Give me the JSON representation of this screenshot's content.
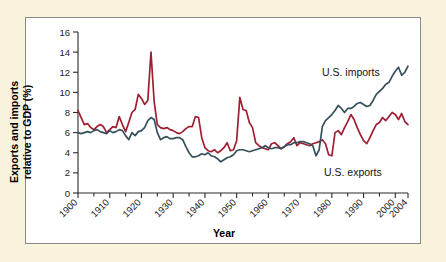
{
  "figure": {
    "background_color": "#f7f3dc",
    "panel_color": "#ffffff",
    "border_color": "#8a8a84"
  },
  "labels": {
    "ylabel_line1": "Exports and imports",
    "ylabel_line2": "relative to GDP (%)",
    "xlabel": "Year",
    "imports_label": "U.S. imports",
    "exports_label": "U.S. exports"
  },
  "chart_data": {
    "type": "line",
    "title": "",
    "xlabel": "Year",
    "ylabel": "Exports and imports relative to GDP (%)",
    "xlim": [
      1900,
      2004
    ],
    "ylim": [
      0,
      16
    ],
    "ytick_values": [
      0,
      2,
      4,
      6,
      8,
      10,
      12,
      14,
      16
    ],
    "xtick_values": [
      1900,
      1910,
      1920,
      1930,
      1940,
      1950,
      1960,
      1970,
      1980,
      1990,
      2000,
      2004
    ],
    "xtick_labels": [
      "1900",
      "1910",
      "1920",
      "1930",
      "1940",
      "1950",
      "1960",
      "1970",
      "1980",
      "1990",
      "2000",
      "2004"
    ],
    "grid": false,
    "legend_position": "inline-annotation",
    "colors": {
      "imports": "#36505c",
      "exports": "#9e1f32"
    },
    "x": [
      1900,
      1901,
      1902,
      1903,
      1904,
      1905,
      1906,
      1907,
      1908,
      1909,
      1910,
      1911,
      1912,
      1913,
      1914,
      1915,
      1916,
      1917,
      1918,
      1919,
      1920,
      1921,
      1922,
      1923,
      1924,
      1925,
      1926,
      1927,
      1928,
      1929,
      1930,
      1931,
      1932,
      1933,
      1934,
      1935,
      1936,
      1937,
      1938,
      1939,
      1940,
      1941,
      1942,
      1943,
      1944,
      1945,
      1946,
      1947,
      1948,
      1949,
      1950,
      1951,
      1952,
      1953,
      1954,
      1955,
      1956,
      1957,
      1958,
      1959,
      1960,
      1961,
      1962,
      1963,
      1964,
      1965,
      1966,
      1967,
      1968,
      1969,
      1970,
      1971,
      1972,
      1973,
      1974,
      1975,
      1976,
      1977,
      1978,
      1979,
      1980,
      1981,
      1982,
      1983,
      1984,
      1985,
      1986,
      1987,
      1988,
      1989,
      1990,
      1991,
      1992,
      1993,
      1994,
      1995,
      1996,
      1997,
      1998,
      1999,
      2000,
      2001,
      2002,
      2003,
      2004
    ],
    "series": [
      {
        "name": "U.S. exports",
        "color": "#9e1f32",
        "values": [
          8.2,
          7.5,
          6.8,
          6.9,
          6.5,
          6.3,
          6.6,
          6.8,
          6.6,
          6.0,
          6.3,
          6.6,
          6.5,
          7.6,
          6.8,
          6.1,
          7.0,
          8.0,
          8.3,
          9.8,
          9.4,
          8.8,
          9.2,
          14.0,
          9.1,
          6.8,
          6.5,
          6.4,
          6.5,
          6.3,
          6.2,
          6.0,
          5.9,
          6.1,
          6.4,
          6.6,
          6.6,
          7.6,
          7.5,
          5.5,
          4.5,
          4.2,
          4.1,
          4.3,
          4.0,
          4.2,
          4.5,
          5.0,
          4.2,
          4.3,
          5.2,
          9.5,
          8.3,
          8.2,
          7.0,
          6.5,
          5.0,
          4.7,
          4.5,
          4.4,
          4.3,
          4.9,
          5.0,
          4.7,
          4.4,
          4.6,
          4.9,
          5.1,
          5.5,
          4.7,
          5.0,
          4.9,
          4.8,
          4.7,
          4.9,
          5.0,
          5.1,
          5.3,
          4.9,
          3.8,
          3.7,
          6.0,
          6.2,
          5.8,
          6.5,
          7.1,
          7.8,
          7.3,
          6.5,
          5.8,
          5.2,
          4.9,
          5.5,
          6.2,
          6.8,
          7.0,
          7.5,
          7.2,
          7.6,
          8.0,
          7.8,
          7.3,
          7.9,
          7.1,
          6.8
        ]
      },
      {
        "name": "U.S. imports",
        "color": "#36505c",
        "values": [
          6.0,
          5.9,
          6.0,
          6.1,
          6.0,
          6.2,
          6.3,
          6.1,
          6.0,
          5.9,
          6.2,
          6.0,
          6.1,
          6.3,
          6.2,
          5.7,
          5.3,
          6.0,
          5.7,
          6.1,
          6.2,
          6.5,
          7.2,
          7.5,
          7.3,
          6.0,
          5.3,
          5.5,
          5.6,
          5.4,
          5.4,
          5.5,
          5.5,
          5.3,
          4.6,
          4.0,
          3.6,
          3.6,
          3.7,
          3.9,
          3.8,
          4.0,
          3.7,
          3.6,
          3.4,
          3.1,
          3.3,
          3.5,
          3.6,
          3.8,
          4.2,
          4.3,
          4.3,
          4.2,
          4.1,
          4.2,
          4.3,
          4.4,
          4.5,
          4.7,
          4.5,
          4.4,
          4.5,
          4.5,
          4.4,
          4.6,
          4.8,
          4.8,
          5.0,
          5.0,
          5.1,
          5.1,
          5.0,
          4.9,
          4.7,
          3.7,
          4.3,
          6.6,
          7.2,
          7.5,
          7.8,
          8.2,
          8.7,
          8.4,
          8.0,
          8.4,
          8.4,
          8.6,
          8.9,
          9.0,
          8.8,
          8.6,
          8.7,
          9.2,
          9.8,
          10.1,
          10.4,
          10.8,
          11.0,
          11.6,
          12.1,
          12.5,
          11.7,
          12.0,
          12.6
        ]
      }
    ]
  }
}
